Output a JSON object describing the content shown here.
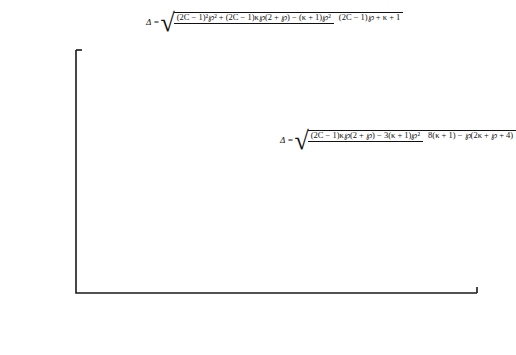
{
  "figure": {
    "background": "#ffffff",
    "foreground": "#1a1a1a"
  },
  "axes": {
    "x_label": "2C",
    "y_label": "Δ",
    "x_ticks": [
      "0",
      "5",
      "10",
      "15",
      "20",
      "25",
      "30",
      "35"
    ],
    "y_ticks": [
      "0,0",
      "0,5",
      "1,0",
      "1,5",
      "2,0"
    ]
  },
  "annotations": {
    "upper_formula": {
      "lhs": "Δ =",
      "numerator": "(2C − 1)²℘² + (2C − 1)κ℘(2 + ℘) − (κ + 1)℘²",
      "denominator": "(2C − 1)℘ + κ + 1",
      "points_to": "upper-curve"
    },
    "lower_formula": {
      "lhs": "Δ =",
      "numerator": "(2C − 1)κ℘(2 + ℘) − 3(κ + 1)℘²",
      "denominator": "8(κ + 1) − ℘(2κ + ℘ + 4)",
      "points_to": "lower-curve"
    }
  },
  "chart_data": {
    "type": "scatter",
    "title": "",
    "xlabel": "2C",
    "ylabel": "Δ",
    "xlim": [
      0,
      35
    ],
    "ylim": [
      0,
      2.0
    ],
    "x_major_step": 5,
    "x_minor_step": 2.5,
    "y_major_step": 0.5,
    "y_minor_step": 0.25,
    "grid": false,
    "legend": "none",
    "decimal_separator": ",",
    "series": [
      {
        "name": "upper-curve",
        "kind": "fitted-curve-with-points",
        "points": [
          {
            "x": 2,
            "y": 0.39
          },
          {
            "x": 5,
            "y": 0.77
          },
          {
            "x": 8,
            "y": 1.02
          },
          {
            "x": 10,
            "y": 1.12
          },
          {
            "x": 12,
            "y": 1.26
          },
          {
            "x": 20,
            "y": 1.63
          }
        ],
        "curve": [
          {
            "x": 1.1,
            "y": 0.0
          },
          {
            "x": 1.3,
            "y": 0.16
          },
          {
            "x": 1.6,
            "y": 0.26
          },
          {
            "x": 2.0,
            "y": 0.37
          },
          {
            "x": 3.0,
            "y": 0.55
          },
          {
            "x": 4.0,
            "y": 0.68
          },
          {
            "x": 5.0,
            "y": 0.78
          },
          {
            "x": 6.0,
            "y": 0.87
          },
          {
            "x": 8.0,
            "y": 1.01
          },
          {
            "x": 10.0,
            "y": 1.13
          },
          {
            "x": 12.0,
            "y": 1.24
          },
          {
            "x": 15.0,
            "y": 1.38
          },
          {
            "x": 20.0,
            "y": 1.58
          },
          {
            "x": 25.0,
            "y": 1.76
          },
          {
            "x": 31.0,
            "y": 1.99
          }
        ]
      },
      {
        "name": "lower-curve",
        "kind": "fitted-curve-with-points",
        "points": [
          {
            "x": 7.6,
            "y": 0.305
          },
          {
            "x": 8.0,
            "y": 0.31
          },
          {
            "x": 9.0,
            "y": 0.355
          },
          {
            "x": 9.8,
            "y": 0.395
          },
          {
            "x": 15.0,
            "y": 0.53
          },
          {
            "x": 20.0,
            "y": 0.63
          },
          {
            "x": 30.0,
            "y": 0.78
          }
        ],
        "curve": [
          {
            "x": 1.1,
            "y": 0.0
          },
          {
            "x": 1.5,
            "y": 0.06
          },
          {
            "x": 2.0,
            "y": 0.1
          },
          {
            "x": 3.0,
            "y": 0.16
          },
          {
            "x": 4.0,
            "y": 0.21
          },
          {
            "x": 5.0,
            "y": 0.25
          },
          {
            "x": 6.0,
            "y": 0.28
          },
          {
            "x": 8.0,
            "y": 0.34
          },
          {
            "x": 10.0,
            "y": 0.4
          },
          {
            "x": 12.0,
            "y": 0.45
          },
          {
            "x": 15.0,
            "y": 0.52
          },
          {
            "x": 20.0,
            "y": 0.61
          },
          {
            "x": 25.0,
            "y": 0.7
          },
          {
            "x": 31.0,
            "y": 0.8
          },
          {
            "x": 33.0,
            "y": 0.83
          }
        ]
      }
    ],
    "arrows": [
      {
        "name": "upper-formula-arrow",
        "x": 15.0,
        "y_from": 1.93,
        "y_to": 1.43
      },
      {
        "name": "lower-formula-arrow",
        "x": 24.6,
        "y_from": 1.03,
        "y_to": 0.7
      }
    ]
  }
}
